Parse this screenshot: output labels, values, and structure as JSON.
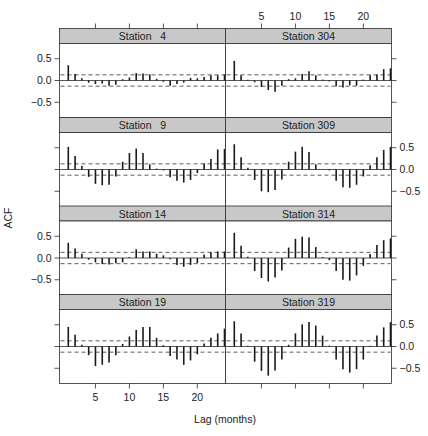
{
  "chart_data": {
    "type": "bar",
    "subtype": "acf-lattice",
    "xlabel": "Lag (months)",
    "ylabel": "ACF",
    "xlim": [
      0,
      24
    ],
    "ylim": [
      -0.85,
      0.85
    ],
    "x_ticks": [
      5,
      10,
      15,
      20
    ],
    "y_ticks": [
      -0.5,
      0.0,
      0.5
    ],
    "y_tick_labels": [
      "-0.5",
      "0.0",
      "0.5"
    ],
    "x_tick_labels": [
      "5",
      "10",
      "15",
      "20"
    ],
    "lags": [
      1,
      2,
      3,
      4,
      5,
      6,
      7,
      8,
      9,
      10,
      11,
      12,
      13,
      14,
      15,
      16,
      17,
      18,
      19,
      20,
      21,
      22,
      23,
      24
    ],
    "confidence_band": [
      -0.13,
      0.13
    ],
    "grid": false,
    "legend": null,
    "panels": [
      {
        "title": "Station   4",
        "col": 0,
        "row": 0,
        "values": [
          0.35,
          0.15,
          0.05,
          -0.05,
          -0.08,
          -0.07,
          -0.12,
          -0.1,
          0.03,
          0.07,
          0.17,
          0.16,
          0.14,
          0.04,
          -0.03,
          -0.12,
          -0.08,
          -0.05,
          0.06,
          0.05,
          0.08,
          0.12,
          0.12,
          0.14
        ]
      },
      {
        "title": "Station 304",
        "col": 1,
        "row": 0,
        "values": [
          0.45,
          0.12,
          0.02,
          -0.04,
          -0.15,
          -0.22,
          -0.26,
          -0.12,
          0.03,
          0.05,
          0.15,
          0.21,
          0.12,
          0.02,
          -0.02,
          -0.13,
          -0.16,
          -0.11,
          -0.12,
          0.02,
          0.12,
          0.14,
          0.26,
          0.28
        ]
      },
      {
        "title": "Station   9",
        "col": 0,
        "row": 1,
        "values": [
          0.52,
          0.31,
          0.08,
          -0.17,
          -0.33,
          -0.36,
          -0.35,
          -0.16,
          0.18,
          0.38,
          0.48,
          0.38,
          0.12,
          0.02,
          -0.02,
          -0.18,
          -0.26,
          -0.3,
          -0.24,
          -0.08,
          0.14,
          0.24,
          0.46,
          0.47
        ]
      },
      {
        "title": "Station 309",
        "col": 1,
        "row": 1,
        "values": [
          0.58,
          0.28,
          0.04,
          -0.24,
          -0.5,
          -0.52,
          -0.47,
          -0.23,
          0.18,
          0.41,
          0.52,
          0.4,
          0.12,
          0.01,
          -0.02,
          -0.26,
          -0.41,
          -0.42,
          -0.35,
          -0.16,
          0.1,
          0.28,
          0.45,
          0.52
        ]
      },
      {
        "title": "Station 14",
        "col": 0,
        "row": 2,
        "values": [
          0.35,
          0.22,
          0.1,
          -0.04,
          -0.1,
          -0.14,
          -0.15,
          -0.12,
          -0.1,
          0.02,
          0.2,
          0.15,
          0.15,
          0.1,
          0.06,
          -0.03,
          -0.16,
          -0.2,
          -0.16,
          -0.12,
          0.08,
          0.13,
          0.15,
          0.15
        ]
      },
      {
        "title": "Station 314",
        "col": 1,
        "row": 2,
        "values": [
          0.58,
          0.28,
          0.03,
          -0.3,
          -0.46,
          -0.54,
          -0.45,
          -0.29,
          0.24,
          0.44,
          0.49,
          0.47,
          0.25,
          0.02,
          -0.05,
          -0.3,
          -0.5,
          -0.52,
          -0.4,
          -0.18,
          0.09,
          0.3,
          0.41,
          0.45
        ]
      },
      {
        "title": "Station 19",
        "col": 0,
        "row": 3,
        "values": [
          0.45,
          0.27,
          0.04,
          -0.2,
          -0.45,
          -0.42,
          -0.37,
          -0.2,
          0.06,
          0.23,
          0.38,
          0.45,
          0.45,
          0.2,
          0.03,
          -0.22,
          -0.3,
          -0.42,
          -0.32,
          -0.18,
          0.07,
          0.2,
          0.3,
          0.41
        ]
      },
      {
        "title": "Station 319",
        "col": 1,
        "row": 3,
        "values": [
          0.58,
          0.3,
          0.02,
          -0.35,
          -0.56,
          -0.67,
          -0.55,
          -0.3,
          0.04,
          0.3,
          0.51,
          0.56,
          0.48,
          0.25,
          0.02,
          -0.3,
          -0.52,
          -0.6,
          -0.52,
          -0.3,
          0.02,
          0.25,
          0.44,
          0.56
        ]
      }
    ],
    "layout": {
      "strip_color": "#c8c8c8",
      "frame_color": "#2b2b2b",
      "bar_color": "#1a1a1a",
      "dash_color": "#333333",
      "top_axis_ticks_on": "top-right-column and bottom-left-column alternate",
      "left_axis_labels_rows": [
        0,
        2
      ],
      "right_axis_labels_rows": [
        1,
        3
      ]
    }
  }
}
